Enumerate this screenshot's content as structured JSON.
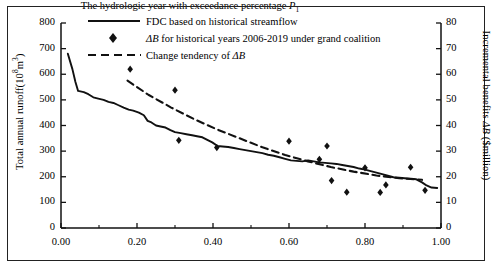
{
  "figure": {
    "background": "#ffffff",
    "line_color": "#111111",
    "marker_color": "#111111"
  },
  "axes": {
    "x": {
      "label_prefix": "The hydrologic year with exceedance percentage ",
      "label_symbol": "P",
      "label_subscript": "1",
      "ticks": [
        "0.00",
        "0.20",
        "0.40",
        "0.60",
        "0.80",
        "1.00"
      ],
      "min": 0.0,
      "max": 1.0,
      "minor_ticks": true
    },
    "y_left": {
      "label_prefix": "Total annual runoff(10",
      "label_exponent": "8",
      "label_middle": "m",
      "label_exponent2": "3",
      "label_suffix": ")",
      "ticks": [
        "0",
        "100",
        "200",
        "300",
        "400",
        "500",
        "600",
        "700",
        "800"
      ],
      "min": 0,
      "max": 800
    },
    "y_right": {
      "label_line1_prefix": "Incremental benefits ",
      "label_symbol": "ΔB",
      "label_line2": "($million)",
      "ticks": [
        "0",
        "10",
        "20",
        "30",
        "40",
        "50",
        "60",
        "70",
        "80"
      ],
      "min": 0,
      "max": 80
    }
  },
  "legend": {
    "items": [
      {
        "marker": "solid-line",
        "label": "FDC based on historical streamflow"
      },
      {
        "marker": "diamond",
        "label_prefix": "ΔB",
        "label": " for historical years 2006-2019 under grand coalition"
      },
      {
        "marker": "dashed-line",
        "label": "Change tendency of ",
        "label_suffix": "ΔB"
      }
    ]
  },
  "chart_data": {
    "type": "line",
    "title": "",
    "xlabel": "The hydrologic year with exceedance percentage P1",
    "ylabel": "Total annual runoff(10^8 m^3)",
    "ylabel_secondary": "Incremental benefits ΔB ($million)",
    "xlim": [
      0.0,
      1.0
    ],
    "ylim": [
      0,
      800
    ],
    "ylim_secondary": [
      0,
      80
    ],
    "grid": false,
    "legend_position": "top-center",
    "series": [
      {
        "name": "FDC based on historical streamflow",
        "type": "line",
        "style": "solid",
        "axis": "left",
        "points": [
          [
            0.018,
            680
          ],
          [
            0.03,
            620
          ],
          [
            0.038,
            570
          ],
          [
            0.045,
            535
          ],
          [
            0.06,
            530
          ],
          [
            0.072,
            522
          ],
          [
            0.085,
            510
          ],
          [
            0.098,
            505
          ],
          [
            0.112,
            500
          ],
          [
            0.125,
            492
          ],
          [
            0.138,
            488
          ],
          [
            0.15,
            480
          ],
          [
            0.165,
            470
          ],
          [
            0.178,
            462
          ],
          [
            0.19,
            458
          ],
          [
            0.205,
            450
          ],
          [
            0.218,
            440
          ],
          [
            0.228,
            418
          ],
          [
            0.238,
            412
          ],
          [
            0.25,
            400
          ],
          [
            0.262,
            396
          ],
          [
            0.275,
            392
          ],
          [
            0.288,
            382
          ],
          [
            0.3,
            374
          ],
          [
            0.315,
            370
          ],
          [
            0.33,
            366
          ],
          [
            0.345,
            362
          ],
          [
            0.358,
            358
          ],
          [
            0.372,
            354
          ],
          [
            0.385,
            344
          ],
          [
            0.398,
            334
          ],
          [
            0.412,
            320
          ],
          [
            0.425,
            318
          ],
          [
            0.44,
            316
          ],
          [
            0.455,
            312
          ],
          [
            0.47,
            308
          ],
          [
            0.485,
            304
          ],
          [
            0.5,
            300
          ],
          [
            0.515,
            296
          ],
          [
            0.53,
            292
          ],
          [
            0.545,
            286
          ],
          [
            0.56,
            282
          ],
          [
            0.575,
            276
          ],
          [
            0.59,
            270
          ],
          [
            0.605,
            264
          ],
          [
            0.62,
            262
          ],
          [
            0.635,
            260
          ],
          [
            0.65,
            264
          ],
          [
            0.665,
            260
          ],
          [
            0.68,
            256
          ],
          [
            0.695,
            254
          ],
          [
            0.71,
            252
          ],
          [
            0.725,
            250
          ],
          [
            0.74,
            246
          ],
          [
            0.755,
            242
          ],
          [
            0.77,
            238
          ],
          [
            0.785,
            232
          ],
          [
            0.8,
            228
          ],
          [
            0.815,
            222
          ],
          [
            0.83,
            216
          ],
          [
            0.845,
            210
          ],
          [
            0.86,
            204
          ],
          [
            0.875,
            198
          ],
          [
            0.89,
            196
          ],
          [
            0.905,
            194
          ],
          [
            0.92,
            192
          ],
          [
            0.935,
            190
          ],
          [
            0.95,
            178
          ],
          [
            0.962,
            166
          ],
          [
            0.975,
            158
          ],
          [
            0.99,
            156
          ]
        ]
      },
      {
        "name": "Change tendency of ΔB",
        "type": "line",
        "style": "dashed",
        "axis": "right",
        "points": [
          [
            0.175,
            57.5
          ],
          [
            0.23,
            52.0
          ],
          [
            0.29,
            47.0
          ],
          [
            0.35,
            42.5
          ],
          [
            0.41,
            38.5
          ],
          [
            0.47,
            35.0
          ],
          [
            0.53,
            31.5
          ],
          [
            0.59,
            28.5
          ],
          [
            0.65,
            26.0
          ],
          [
            0.71,
            23.8
          ],
          [
            0.77,
            22.0
          ],
          [
            0.83,
            20.5
          ],
          [
            0.89,
            19.4
          ],
          [
            0.95,
            18.8
          ]
        ]
      },
      {
        "name": "ΔB for historical years 2006-2019 under grand coalition",
        "type": "scatter",
        "marker": "diamond",
        "axis": "right",
        "points": [
          [
            0.182,
            62.0
          ],
          [
            0.3,
            53.8
          ],
          [
            0.31,
            34.2
          ],
          [
            0.41,
            31.4
          ],
          [
            0.6,
            33.9
          ],
          [
            0.68,
            26.8
          ],
          [
            0.7,
            32.0
          ],
          [
            0.712,
            18.5
          ],
          [
            0.752,
            14.0
          ],
          [
            0.8,
            23.5
          ],
          [
            0.84,
            13.9
          ],
          [
            0.855,
            16.8
          ],
          [
            0.92,
            23.7
          ],
          [
            0.958,
            14.7
          ]
        ]
      }
    ]
  }
}
